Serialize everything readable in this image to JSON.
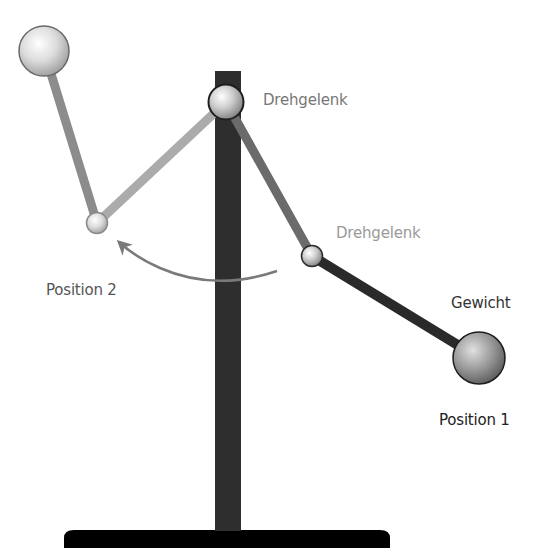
{
  "diagram": {
    "type": "double-pendulum-illustration",
    "labels": {
      "joint_top": "Drehgelenk",
      "joint_middle": "Drehgelenk",
      "weight": "Gewicht",
      "position_1": "Position 1",
      "position_2": "Position 2"
    },
    "colors": {
      "background": "#ffffff",
      "pole": "#2e2e2e",
      "base": "#000000",
      "arm_pos1_upper": "#6b6b6b",
      "arm_pos1_lower": "#2a2a2a",
      "arm_pos2_upper": "#ababab",
      "arm_pos2_lower": "#8c8c8c",
      "arrow": "#7a7a7a",
      "label_joint_top": "#777777",
      "label_joint_middle": "#9a9a9a",
      "label_weight": "#333333",
      "label_position_1": "#222222",
      "label_position_2": "#555555"
    }
  }
}
